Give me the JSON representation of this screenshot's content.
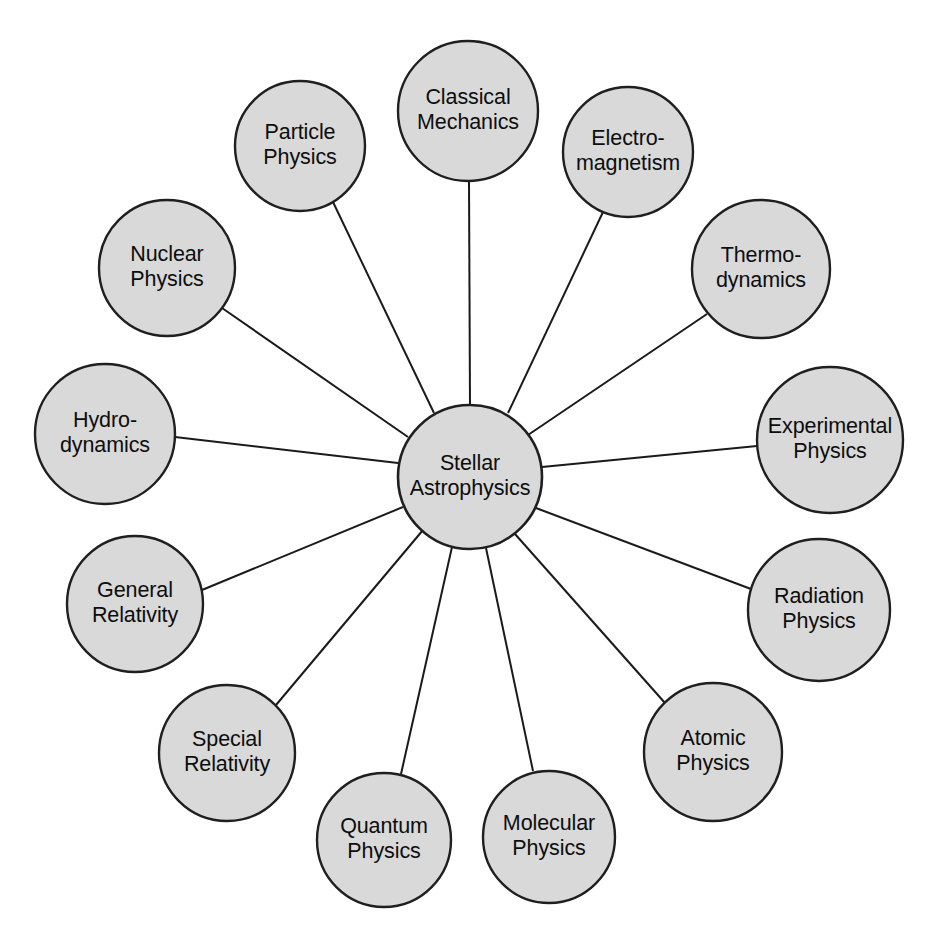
{
  "diagram": {
    "type": "radial-mind-map",
    "colors": {
      "node_fill": "#d9d9d9",
      "node_stroke": "#1f1f1f",
      "spoke_stroke": "#1a1a1a",
      "text": "#0d0d0d",
      "background": "#ffffff"
    },
    "center": {
      "id": "stellar-astrophysics",
      "label": "Stellar Astrophysics",
      "lines": [
        "Stellar",
        "Astrophysics"
      ],
      "cx": 470,
      "cy": 477,
      "r": 72
    },
    "nodes": [
      {
        "id": "classical-mechanics",
        "label": "Classical Mechanics",
        "lines": [
          "Classical",
          "Mechanics"
        ],
        "cx": 468,
        "cy": 111,
        "r": 70,
        "link_from": {
          "x": 469,
          "y": 181
        },
        "link_to": {
          "x": 470,
          "y": 405
        }
      },
      {
        "id": "electromagnetism",
        "label": "Electro-magnetism",
        "lines": [
          "Electro-",
          "magnetism"
        ],
        "cx": 628,
        "cy": 152,
        "r": 65,
        "link_from": {
          "x": 603,
          "y": 212
        },
        "link_to": {
          "x": 508,
          "y": 413
        }
      },
      {
        "id": "thermodynamics",
        "label": "Thermo-dynamics",
        "lines": [
          "Thermo-",
          "dynamics"
        ],
        "cx": 761,
        "cy": 269,
        "r": 69,
        "link_from": {
          "x": 707,
          "y": 314
        },
        "link_to": {
          "x": 528,
          "y": 435
        }
      },
      {
        "id": "experimental-physics",
        "label": "Experimental Physics",
        "lines": [
          "Experimental",
          "Physics"
        ],
        "cx": 830,
        "cy": 440,
        "r": 73,
        "link_from": {
          "x": 757,
          "y": 446
        },
        "link_to": {
          "x": 542,
          "y": 467
        }
      },
      {
        "id": "radiation-physics",
        "label": "Radiation Physics",
        "lines": [
          "Radiation",
          "Physics"
        ],
        "cx": 819,
        "cy": 610,
        "r": 71,
        "link_from": {
          "x": 751,
          "y": 589
        },
        "link_to": {
          "x": 536,
          "y": 508
        }
      },
      {
        "id": "atomic-physics",
        "label": "Atomic Physics",
        "lines": [
          "Atomic",
          "Physics"
        ],
        "cx": 713,
        "cy": 752,
        "r": 69,
        "link_from": {
          "x": 665,
          "y": 703
        },
        "link_to": {
          "x": 515,
          "y": 534
        }
      },
      {
        "id": "molecular-physics",
        "label": "Molecular Physics",
        "lines": [
          "Molecular",
          "Physics"
        ],
        "cx": 549,
        "cy": 837,
        "r": 66,
        "link_from": {
          "x": 533,
          "y": 771
        },
        "link_to": {
          "x": 486,
          "y": 548
        }
      },
      {
        "id": "quantum-physics",
        "label": "Quantum Physics",
        "lines": [
          "Quantum",
          "Physics"
        ],
        "cx": 384,
        "cy": 840,
        "r": 67,
        "link_from": {
          "x": 401,
          "y": 774
        },
        "link_to": {
          "x": 452,
          "y": 547
        }
      },
      {
        "id": "special-relativity",
        "label": "Special Relativity",
        "lines": [
          "Special",
          "Relativity"
        ],
        "cx": 227,
        "cy": 753,
        "r": 68,
        "link_from": {
          "x": 276,
          "y": 705
        },
        "link_to": {
          "x": 423,
          "y": 530
        }
      },
      {
        "id": "general-relativity",
        "label": "General Relativity",
        "lines": [
          "General",
          "Relativity"
        ],
        "cx": 135,
        "cy": 604,
        "r": 68,
        "link_from": {
          "x": 202,
          "y": 590
        },
        "link_to": {
          "x": 403,
          "y": 507
        }
      },
      {
        "id": "hydrodynamics",
        "label": "Hydro-dynamics",
        "lines": [
          "Hydro-",
          "dynamics"
        ],
        "cx": 105,
        "cy": 434,
        "r": 70,
        "link_from": {
          "x": 175,
          "y": 437
        },
        "link_to": {
          "x": 398,
          "y": 463
        }
      },
      {
        "id": "nuclear-physics",
        "label": "Nuclear Physics",
        "lines": [
          "Nuclear",
          "Physics"
        ],
        "cx": 167,
        "cy": 268,
        "r": 68,
        "link_from": {
          "x": 222,
          "y": 308
        },
        "link_to": {
          "x": 408,
          "y": 437
        }
      },
      {
        "id": "particle-physics",
        "label": "Particle Physics",
        "lines": [
          "Particle",
          "Physics"
        ],
        "cx": 300,
        "cy": 146,
        "r": 65,
        "link_from": {
          "x": 333,
          "y": 202
        },
        "link_to": {
          "x": 434,
          "y": 413
        }
      }
    ]
  }
}
